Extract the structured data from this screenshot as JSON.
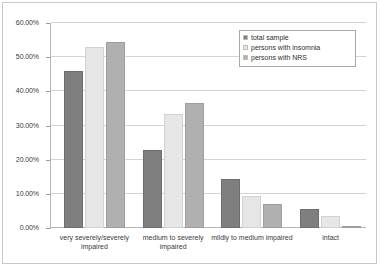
{
  "chart_data": {
    "type": "bar",
    "title": "",
    "xlabel": "",
    "ylabel": "",
    "ylim": [
      0,
      60
    ],
    "grid": true,
    "legend_position": "top-right",
    "categories": [
      "very severely/severely impaired",
      "medium to severely impaired",
      "mildly to medium impaired",
      "intact"
    ],
    "ytick_labels": [
      "0.00%",
      "10.00%",
      "20.00%",
      "30.00%",
      "40.00%",
      "50.00%",
      "60.00%"
    ],
    "ytick_values": [
      0,
      10,
      20,
      30,
      40,
      50,
      60
    ],
    "series": [
      {
        "name": "total sample",
        "color": "#7f7f7f",
        "values": [
          46.0,
          22.8,
          14.2,
          5.6
        ]
      },
      {
        "name": "persons with insomnia",
        "color": "#e6e6e6",
        "values": [
          53.0,
          33.5,
          9.5,
          3.5
        ]
      },
      {
        "name": "persons with NRS",
        "color": "#b0b0b0",
        "values": [
          54.5,
          36.5,
          7.0,
          0.6
        ]
      }
    ]
  }
}
